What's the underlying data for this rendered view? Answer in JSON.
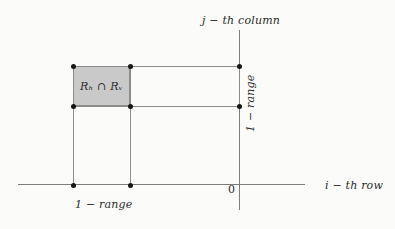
{
  "figure": {
    "background_color": "#fbfbfa",
    "line_color": "#8c8c8c",
    "dot_color": "#161616",
    "shade_color": "#c9c9c9"
  },
  "labels": {
    "column_axis": "j − th column",
    "row_axis": "i − th row",
    "origin": "0",
    "bottom_range": "1 − range",
    "right_range": "1 − range",
    "intersection": "Rₕ ∩ Rᵥ"
  },
  "geometry": {
    "axes": {
      "horizontal": {
        "x1": 18,
        "x2": 305,
        "y": 185
      },
      "vertical": {
        "x": 239,
        "y1": 30,
        "y2": 210
      },
      "origin": {
        "x": 239,
        "y": 185
      }
    },
    "shaded_rect": {
      "x": 73,
      "y": 66,
      "width": 57,
      "height": 40
    },
    "vertical_range_rect": {
      "x1": 73,
      "x2": 130,
      "y1": 66,
      "y2": 185
    },
    "horizontal_range_rect": {
      "x1": 73,
      "x2": 239,
      "y1": 66,
      "y2": 106
    },
    "dots": [
      {
        "name": "rect-top-left",
        "x": 73,
        "y": 66
      },
      {
        "name": "rect-top-right",
        "x": 130,
        "y": 66
      },
      {
        "name": "axis-top",
        "x": 239,
        "y": 66
      },
      {
        "name": "rect-bottom-left",
        "x": 73,
        "y": 106
      },
      {
        "name": "rect-bottom-right",
        "x": 130,
        "y": 106
      },
      {
        "name": "axis-bottom",
        "x": 239,
        "y": 106
      },
      {
        "name": "baseline-left",
        "x": 73,
        "y": 185
      },
      {
        "name": "baseline-right",
        "x": 130,
        "y": 185
      }
    ]
  }
}
